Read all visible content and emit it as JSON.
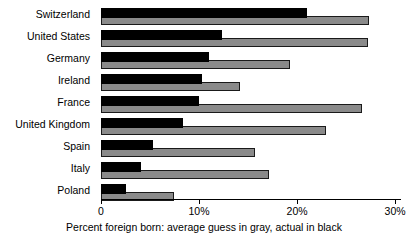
{
  "chart_data": {
    "type": "bar",
    "orientation": "horizontal",
    "title": "",
    "subtitle": "",
    "xlabel": "Percent foreign born:  average guess in gray, actual in black",
    "ylabel": "",
    "xlim": [
      0,
      30.6
    ],
    "grid": false,
    "legend_position": "none",
    "categories": [
      "Switzerland",
      "United States",
      "Germany",
      "Ireland",
      "France",
      "United Kingdom",
      "Spain",
      "Italy",
      "Poland"
    ],
    "series": [
      {
        "name": "actual in black",
        "color": "#000000",
        "values": [
          21.0,
          12.3,
          11.0,
          10.3,
          10.0,
          8.4,
          5.3,
          4.1,
          2.5
        ]
      },
      {
        "name": "average guess in gray",
        "color": "#8a8a8a",
        "values": [
          27.3,
          27.2,
          19.3,
          14.2,
          26.6,
          23.0,
          15.7,
          17.1,
          7.4
        ]
      }
    ],
    "xticks": [
      0,
      10,
      20,
      30
    ],
    "xtick_labels": [
      "0",
      "10%",
      "20%",
      "30%"
    ]
  },
  "caption": "Percent foreign born:  average guess in gray, actual in black"
}
